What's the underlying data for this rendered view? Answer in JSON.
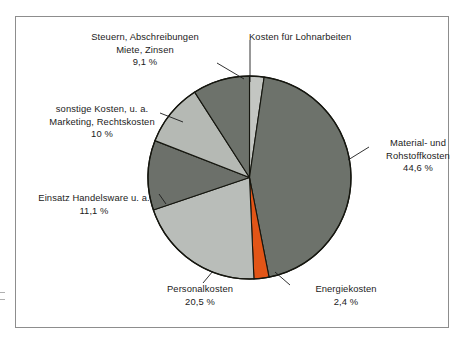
{
  "figure": {
    "frame_border_color": "#8d8d8d",
    "background": "#ffffff"
  },
  "chart_data": {
    "type": "pie",
    "title": "",
    "subtitle": "",
    "xlabel": "",
    "ylabel": "",
    "legend_position": "callout-labels",
    "grid": false,
    "start_angle_deg": 0,
    "direction": "clockwise",
    "unit": "%",
    "categories": [
      "Kosten für Lohnarbeiten",
      "Material-  und Rohstoffkosten",
      "Energiekosten",
      "Personalkosten",
      "Einsatz Handelsware u. a.",
      "sonstige Kosten, u. a. Marketing, Rechtskosten",
      "Steuern, Abschreibungen Miete, Zinsen"
    ],
    "values": [
      2.3,
      44.6,
      2.4,
      20.5,
      11.1,
      10.0,
      9.1
    ],
    "colors": [
      "#c3c6c2",
      "#6d726b",
      "#e25517",
      "#b9bdb9",
      "#6c706a",
      "#b5b9b4",
      "#6d726b"
    ],
    "slices": [
      {
        "key": "lohnarbeiten",
        "label_line1": "Kosten für Lohnarbeiten",
        "label_line2": "",
        "label_line3": "",
        "value": 2.3,
        "value_text": "",
        "color": "#c3c6c2",
        "start_deg": 0,
        "end_deg": 8.3
      },
      {
        "key": "material",
        "label_line1": "Material-  und",
        "label_line2": "Rohstoffkosten",
        "label_line3": "44,6 %",
        "value": 44.6,
        "value_text": "44,6 %",
        "color": "#6d726b",
        "start_deg": 8.3,
        "end_deg": 168.9
      },
      {
        "key": "energie",
        "label_line1": "Energiekosten",
        "label_line2": "2,4 %",
        "label_line3": "",
        "value": 2.4,
        "value_text": "2,4 %",
        "color": "#e25517",
        "start_deg": 168.9,
        "end_deg": 177.5
      },
      {
        "key": "personal",
        "label_line1": "Personalkosten",
        "label_line2": "20,5 %",
        "label_line3": "",
        "value": 20.5,
        "value_text": "20,5 %",
        "color": "#b9bdb9",
        "start_deg": 177.5,
        "end_deg": 251.3
      },
      {
        "key": "handelsware",
        "label_line1": "Einsatz Handelsware u. a.",
        "label_line2": "11,1 %",
        "label_line3": "",
        "value": 11.1,
        "value_text": "11,1 %",
        "color": "#6c706a",
        "start_deg": 251.3,
        "end_deg": 291.3
      },
      {
        "key": "sonstige",
        "label_line1": "sonstige Kosten, u. a.",
        "label_line2": "Marketing, Rechtskosten",
        "label_line3": "10 %",
        "value": 10.0,
        "value_text": "10 %",
        "color": "#b5b9b4",
        "start_deg": 291.3,
        "end_deg": 327.3
      },
      {
        "key": "steuern",
        "label_line1": "Steuern, Abschreibungen",
        "label_line2": "Miete, Zinsen",
        "label_line3": "9,1 %",
        "value": 9.1,
        "value_text": "9,1 %",
        "color": "#6d726b",
        "start_deg": 327.3,
        "end_deg": 360
      }
    ]
  },
  "labels": {
    "steuern": {
      "line1": "Steuern, Abschreibungen",
      "line2": "Miete, Zinsen",
      "line3": "9,1 %"
    },
    "lohnarbeiten": {
      "line1": "Kosten für Lohnarbeiten"
    },
    "sonstige": {
      "line1": "sonstige Kosten, u. a.",
      "line2": "Marketing, Rechtskosten",
      "line3": "10 %"
    },
    "handelsware": {
      "line1": "Einsatz Handelsware u. a.",
      "line2": "11,1 %"
    },
    "material": {
      "line1": "Material-  und",
      "line2": "Rohstoffkosten",
      "line3": "44,6 %"
    },
    "personal": {
      "line1": "Personalkosten",
      "line2": "20,5 %"
    },
    "energie": {
      "line1": "Energiekosten",
      "line2": "2,4 %"
    }
  }
}
